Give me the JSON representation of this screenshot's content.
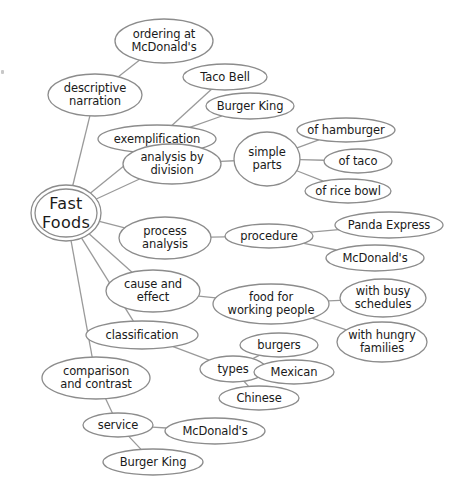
{
  "diagram": {
    "colors": {
      "stroke": "#8c8c8c",
      "edge": "#9a9a9a",
      "text": "#1a1a1a",
      "background": "#ffffff"
    },
    "root": {
      "id": "fast-foods",
      "lines": [
        "Fast",
        "Foods"
      ],
      "cx": 66,
      "cy": 213,
      "rx": 35,
      "ry": 28
    },
    "nodes": [
      {
        "id": "descriptive-narration",
        "lines": [
          "descriptive",
          "narration"
        ],
        "cx": 95,
        "cy": 95,
        "rx": 47,
        "ry": 21
      },
      {
        "id": "ordering-at-mcdonalds",
        "lines": [
          "ordering at",
          "McDonald's"
        ],
        "cx": 164,
        "cy": 41,
        "rx": 49,
        "ry": 22
      },
      {
        "id": "exemplification",
        "lines": [
          "exemplification"
        ],
        "cx": 157,
        "cy": 139,
        "rx": 59,
        "ry": 14
      },
      {
        "id": "taco-bell",
        "lines": [
          "Taco Bell"
        ],
        "cx": 225,
        "cy": 77,
        "rx": 42,
        "ry": 13
      },
      {
        "id": "burger-king-example",
        "lines": [
          "Burger King"
        ],
        "cx": 250,
        "cy": 106,
        "rx": 44,
        "ry": 13
      },
      {
        "id": "analysis-by-division",
        "lines": [
          "analysis by",
          "division"
        ],
        "cx": 172,
        "cy": 164,
        "rx": 49,
        "ry": 20
      },
      {
        "id": "simple-parts",
        "lines": [
          "simple",
          "parts"
        ],
        "cx": 267,
        "cy": 159,
        "rx": 33,
        "ry": 27
      },
      {
        "id": "of-hamburger",
        "lines": [
          "of hamburger"
        ],
        "cx": 346,
        "cy": 130,
        "rx": 49,
        "ry": 12
      },
      {
        "id": "of-taco",
        "lines": [
          "of taco"
        ],
        "cx": 358,
        "cy": 161,
        "rx": 34,
        "ry": 12
      },
      {
        "id": "of-rice-bowl",
        "lines": [
          "of rice bowl"
        ],
        "cx": 348,
        "cy": 191,
        "rx": 43,
        "ry": 12
      },
      {
        "id": "process-analysis",
        "lines": [
          "process",
          "analysis"
        ],
        "cx": 165,
        "cy": 238,
        "rx": 46,
        "ry": 21
      },
      {
        "id": "procedure",
        "lines": [
          "procedure"
        ],
        "cx": 269,
        "cy": 236,
        "rx": 44,
        "ry": 12
      },
      {
        "id": "panda-express",
        "lines": [
          "Panda Express"
        ],
        "cx": 389,
        "cy": 225,
        "rx": 54,
        "ry": 13
      },
      {
        "id": "mcdonalds-procedure",
        "lines": [
          "McDonald's"
        ],
        "cx": 375,
        "cy": 258,
        "rx": 49,
        "ry": 13
      },
      {
        "id": "cause-and-effect",
        "lines": [
          "cause and",
          "effect"
        ],
        "cx": 153,
        "cy": 291,
        "rx": 47,
        "ry": 21
      },
      {
        "id": "food-for-working-people",
        "lines": [
          "food for",
          "working people"
        ],
        "cx": 271,
        "cy": 304,
        "rx": 58,
        "ry": 20
      },
      {
        "id": "with-busy-schedules",
        "lines": [
          "with busy",
          "schedules"
        ],
        "cx": 383,
        "cy": 298,
        "rx": 43,
        "ry": 19
      },
      {
        "id": "with-hungry-families",
        "lines": [
          "with hungry",
          "families"
        ],
        "cx": 382,
        "cy": 342,
        "rx": 45,
        "ry": 20
      },
      {
        "id": "classification",
        "lines": [
          "classification"
        ],
        "cx": 142,
        "cy": 335,
        "rx": 56,
        "ry": 14
      },
      {
        "id": "types",
        "lines": [
          "types"
        ],
        "cx": 233,
        "cy": 369,
        "rx": 33,
        "ry": 13
      },
      {
        "id": "burgers",
        "lines": [
          "burgers"
        ],
        "cx": 279,
        "cy": 345,
        "rx": 39,
        "ry": 12
      },
      {
        "id": "mexican",
        "lines": [
          "Mexican"
        ],
        "cx": 294,
        "cy": 372,
        "rx": 40,
        "ry": 12
      },
      {
        "id": "chinese",
        "lines": [
          "Chinese"
        ],
        "cx": 259,
        "cy": 398,
        "rx": 40,
        "ry": 12
      },
      {
        "id": "comparison-and-contrast",
        "lines": [
          "comparison",
          "and contrast"
        ],
        "cx": 96,
        "cy": 378,
        "rx": 54,
        "ry": 21
      },
      {
        "id": "service",
        "lines": [
          "service"
        ],
        "cx": 118,
        "cy": 425,
        "rx": 35,
        "ry": 12
      },
      {
        "id": "mcdonalds-service",
        "lines": [
          "McDonald's"
        ],
        "cx": 215,
        "cy": 431,
        "rx": 50,
        "ry": 13
      },
      {
        "id": "burger-king-service",
        "lines": [
          "Burger King"
        ],
        "cx": 153,
        "cy": 462,
        "rx": 50,
        "ry": 13
      }
    ],
    "edges": [
      [
        "fast-foods",
        "descriptive-narration"
      ],
      [
        "descriptive-narration",
        "ordering-at-mcdonalds"
      ],
      [
        "fast-foods",
        "exemplification"
      ],
      [
        "exemplification",
        "taco-bell"
      ],
      [
        "exemplification",
        "burger-king-example"
      ],
      [
        "fast-foods",
        "analysis-by-division"
      ],
      [
        "analysis-by-division",
        "simple-parts"
      ],
      [
        "simple-parts",
        "of-hamburger"
      ],
      [
        "simple-parts",
        "of-taco"
      ],
      [
        "simple-parts",
        "of-rice-bowl"
      ],
      [
        "fast-foods",
        "process-analysis"
      ],
      [
        "process-analysis",
        "procedure"
      ],
      [
        "procedure",
        "panda-express"
      ],
      [
        "procedure",
        "mcdonalds-procedure"
      ],
      [
        "fast-foods",
        "cause-and-effect"
      ],
      [
        "cause-and-effect",
        "food-for-working-people"
      ],
      [
        "food-for-working-people",
        "with-busy-schedules"
      ],
      [
        "food-for-working-people",
        "with-hungry-families"
      ],
      [
        "fast-foods",
        "classification"
      ],
      [
        "classification",
        "types"
      ],
      [
        "types",
        "burgers"
      ],
      [
        "types",
        "mexican"
      ],
      [
        "types",
        "chinese"
      ],
      [
        "fast-foods",
        "comparison-and-contrast"
      ],
      [
        "comparison-and-contrast",
        "service"
      ],
      [
        "service",
        "mcdonalds-service"
      ],
      [
        "service",
        "burger-king-service"
      ]
    ]
  }
}
